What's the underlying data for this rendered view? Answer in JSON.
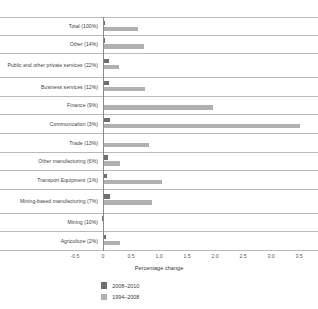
{
  "chart_data": {
    "type": "bar",
    "orientation": "horizontal",
    "title": "",
    "xlabel": "Percentage change",
    "ylabel": "",
    "xlim": [
      -0.75,
      3.55
    ],
    "xticks": [
      "-0.5",
      "0",
      "0.5",
      "1.0",
      "1.5",
      "2.0",
      "2.5",
      "3.0",
      "3.5"
    ],
    "xtick_values": [
      -0.5,
      0,
      0.5,
      1.0,
      1.5,
      2.0,
      2.5,
      3.0,
      3.5
    ],
    "grid": false,
    "legend_position": "bottom",
    "categories": [
      "Total (100%)",
      "Other (14%)",
      "Public and other private services (22%)",
      "Business services (12%)",
      "Finance (9%)",
      "Communication (3%)",
      "Trade (13%)",
      "Other manufacturing (6%)",
      "Transport Equipment (1%)",
      "Mining-based manufacturing (7%)",
      "Mining (10%)",
      "Agriculture (2%)"
    ],
    "series": [
      {
        "name": "2008–2010",
        "color": "#6f6f6f",
        "values": [
          0.03,
          0.03,
          0.11,
          0.1,
          0.02,
          0.13,
          0.02,
          0.09,
          0.07,
          0.12,
          -0.02,
          0.05
        ]
      },
      {
        "name": "1994–2008",
        "color": "#b0b0b0",
        "values": [
          0.62,
          0.74,
          0.29,
          0.75,
          1.97,
          3.52,
          0.83,
          0.3,
          1.06,
          0.87,
          0.02,
          0.3
        ]
      }
    ]
  },
  "colors": {
    "dark": "#6f6f6f",
    "light": "#b0b0b0",
    "gridline": "#b9b9b9",
    "axis": "#8a8a8a",
    "text": "#3a3a3a",
    "background": "#ffffff"
  }
}
